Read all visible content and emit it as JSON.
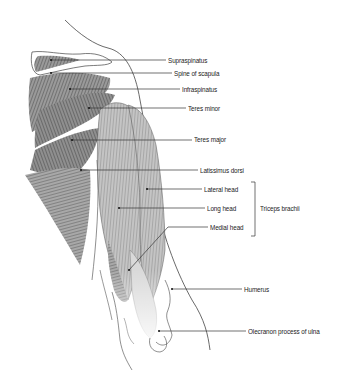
{
  "diagram": {
    "type": "anatomical-illustration",
    "labels": [
      {
        "id": "supraspinatus",
        "text": "Supraspinatus",
        "x": 168,
        "y": 56,
        "point": [
          51,
          60
        ]
      },
      {
        "id": "spine-of-scapula",
        "text": "Spine of scapula",
        "x": 174,
        "y": 69,
        "point": [
          51,
          73
        ]
      },
      {
        "id": "infraspinatus",
        "text": "Infraspinatus",
        "x": 182,
        "y": 85,
        "point": [
          70,
          89
        ]
      },
      {
        "id": "teres-minor",
        "text": "Teres minor",
        "x": 188,
        "y": 104,
        "point": [
          89,
          108
        ]
      },
      {
        "id": "teres-major",
        "text": "Teres major",
        "x": 194,
        "y": 135,
        "point": [
          72,
          140
        ]
      },
      {
        "id": "latissimus-dorsi",
        "text": "Latissimus dorsi",
        "x": 200,
        "y": 166,
        "point": [
          81,
          170
        ]
      },
      {
        "id": "lateral-head",
        "text": "Lateral head",
        "x": 204,
        "y": 185,
        "point": [
          147,
          189
        ]
      },
      {
        "id": "long-head",
        "text": "Long head",
        "x": 207,
        "y": 204,
        "point": [
          119,
          208
        ]
      },
      {
        "id": "medial-head",
        "text": "Medial head",
        "x": 210,
        "y": 223,
        "point": [
          129,
          270
        ]
      },
      {
        "id": "humerus",
        "text": "Humerus",
        "x": 244,
        "y": 285,
        "point": [
          172,
          289
        ]
      },
      {
        "id": "olecranon",
        "text": "Olecranon process of ulna",
        "x": 248,
        "y": 327,
        "point": [
          159,
          331
        ]
      }
    ],
    "group": {
      "text": "Triceps brachii",
      "x": 260,
      "y": 204,
      "bracket": {
        "x": 255,
        "top": 182,
        "bottom": 236
      }
    },
    "colors": {
      "line": "#333333",
      "muscle_dark": "#555555",
      "muscle_light": "#b8b8b8",
      "outline": "#444444"
    }
  }
}
